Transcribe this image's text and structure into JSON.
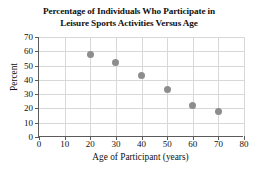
{
  "chart_data": {
    "type": "scatter",
    "title": "Percentage of Individuals Who Participate in Leisure Sports Activities Versus Age",
    "title_line1": "Percentage of Individuals Who Participate in",
    "title_line2": "Leisure Sports Activities Versus Age",
    "xlabel": "Age of Participant (years)",
    "ylabel": "Percent",
    "xlim": [
      0,
      80
    ],
    "ylim": [
      0,
      70
    ],
    "xticks": [
      0,
      10,
      20,
      30,
      40,
      50,
      60,
      70,
      80
    ],
    "yticks": [
      0,
      10,
      20,
      30,
      40,
      50,
      60,
      70
    ],
    "grid": true,
    "legend": null,
    "marker_color": "#8d8d8d",
    "axis_color": "#5b5b5b",
    "grid_color": "#d8d8d8",
    "x": [
      20,
      30,
      40,
      50,
      60,
      70
    ],
    "values": [
      58,
      52,
      43,
      33,
      22,
      18
    ],
    "points": [
      {
        "x": 20,
        "y": 58
      },
      {
        "x": 30,
        "y": 52
      },
      {
        "x": 40,
        "y": 43
      },
      {
        "x": 50,
        "y": 33
      },
      {
        "x": 60,
        "y": 22
      },
      {
        "x": 70,
        "y": 18
      }
    ]
  }
}
